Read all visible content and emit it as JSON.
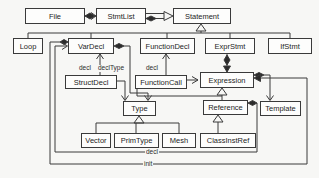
{
  "diagram": {
    "nodes": {
      "file": "File",
      "stmtlist": "StmtList",
      "statement": "Statement",
      "loop": "Loop",
      "vardecl": "VarDecl",
      "functiondecl": "FunctionDecl",
      "exprstmt": "ExprStmt",
      "ifstmt": "IfStmt",
      "structdecl": "StructDecl",
      "functioncall": "FunctionCall",
      "expression": "Expression",
      "type": "Type",
      "reference": "Reference",
      "template": "Template",
      "vector": "Vector",
      "primtype": "PrimType",
      "mesh": "Mesh",
      "classinstref": "ClassInstRef"
    },
    "edge_labels": {
      "struct_decl": "decl",
      "decl_type": "declType",
      "func_decl": "decl",
      "ref_decl": "decl",
      "init": "init"
    },
    "colors": {
      "line": "#3a3a3a",
      "box_fill": "#fdfdfc",
      "background": "#f7f7f5",
      "text": "#1e1e1e"
    }
  }
}
